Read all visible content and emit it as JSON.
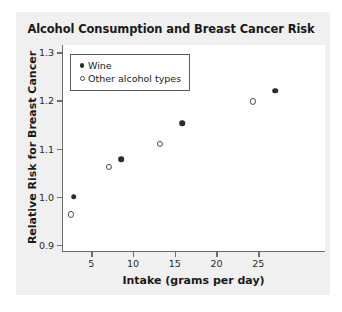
{
  "chart_data": {
    "type": "scatter",
    "title": "Alcohol Consumption and Breast Cancer Risk",
    "xlabel": "Intake (grams per day)",
    "ylabel": "Relative Risk for Breast Cancer",
    "xlim": [
      1.5,
      33.0
    ],
    "ylim": [
      0.885,
      1.315
    ],
    "xticks": [
      5,
      10,
      15,
      20,
      25
    ],
    "xtick_labels": [
      "5",
      "10",
      "15",
      "20",
      "25"
    ],
    "yticks": [
      0.9,
      1.0,
      1.1,
      1.2,
      1.3
    ],
    "ytick_labels": [
      "0.9",
      "1.0",
      "1.1",
      "1.2",
      "1.3"
    ],
    "grid": false,
    "legend_position": "upper left",
    "series": [
      {
        "name": "Wine",
        "marker": "filled-circle",
        "color": "#2b2b2b",
        "points": [
          {
            "x": 2.8,
            "y": 1.0
          },
          {
            "x": 8.5,
            "y": 1.078
          },
          {
            "x": 15.8,
            "y": 1.152
          },
          {
            "x": 26.9,
            "y": 1.22
          }
        ]
      },
      {
        "name": "Other alcohol types",
        "marker": "open-circle",
        "color": "#4a4a4a",
        "points": [
          {
            "x": 2.4,
            "y": 0.963
          },
          {
            "x": 7.0,
            "y": 1.062
          },
          {
            "x": 13.1,
            "y": 1.11
          },
          {
            "x": 24.2,
            "y": 1.198
          }
        ]
      }
    ]
  },
  "figure": {
    "panel_background": "#f0f0f0",
    "plot_background": "#ffffff",
    "axis_color": "#6e6e6e"
  }
}
